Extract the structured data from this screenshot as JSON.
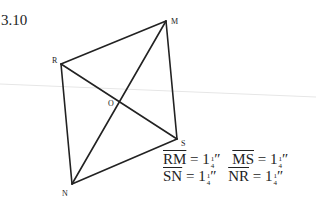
{
  "figure": {
    "number": "3.10",
    "vertices": [
      {
        "label": "M",
        "x": 166,
        "y": 21,
        "lx": 171,
        "ly": 24
      },
      {
        "label": "R",
        "x": 61,
        "y": 64,
        "lx": 52,
        "ly": 63
      },
      {
        "label": "S",
        "x": 177,
        "y": 139,
        "lx": 181,
        "ly": 146
      },
      {
        "label": "N",
        "x": 72,
        "y": 184,
        "lx": 62,
        "ly": 196
      },
      {
        "label": "O",
        "x": 120,
        "y": 102,
        "lx": 108,
        "ly": 106
      }
    ],
    "edges": [
      [
        "R",
        "M"
      ],
      [
        "M",
        "S"
      ],
      [
        "S",
        "N"
      ],
      [
        "N",
        "R"
      ]
    ],
    "diagonals": [
      [
        "R",
        "S"
      ],
      [
        "M",
        "N"
      ]
    ],
    "line_color": "#222222",
    "guide_line_color": "#e6e6e6"
  },
  "measurements": [
    [
      {
        "segment": "RM",
        "equals": "=",
        "whole": "1",
        "num": "1",
        "den": "4",
        "unit": "″"
      },
      {
        "segment": "MS",
        "equals": "=",
        "whole": "1",
        "num": "1",
        "den": "4",
        "unit": "″"
      }
    ],
    [
      {
        "segment": "SN",
        "equals": "=",
        "whole": "1",
        "num": "1",
        "den": "4",
        "unit": "″"
      },
      {
        "segment": "NR",
        "equals": "=",
        "whole": "1",
        "num": "1",
        "den": "4",
        "unit": "″"
      }
    ]
  ]
}
